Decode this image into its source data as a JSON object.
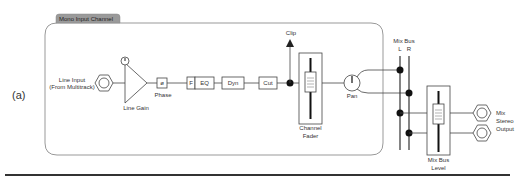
{
  "figure": {
    "label": "(a)",
    "section_title": "Mono Input Channel"
  },
  "input": {
    "line1": "Line Input",
    "line2": "(From Multitrack)",
    "gain_label": "Line Gain",
    "phase_symbol": "ø",
    "phase_label": "Phase"
  },
  "processing": {
    "filter": "F",
    "eq": "EQ",
    "dyn": "Dyn",
    "cut": "Cut"
  },
  "clip": {
    "label": "Clip"
  },
  "channel_fader": {
    "line1": "Channel",
    "line2": "Fader"
  },
  "pan": {
    "label": "Pan"
  },
  "mix_bus": {
    "title": "Mix Bus",
    "left": "L",
    "right": "R",
    "level_line1": "Mix Bus",
    "level_line2": "Level"
  },
  "output": {
    "line1": "Mix",
    "line2": "Stereo",
    "line3": "Output"
  },
  "colors": {
    "line": "#444444",
    "dot": "#111111",
    "tab_fill": "#9a9a9a",
    "box_stroke": "#888888"
  }
}
